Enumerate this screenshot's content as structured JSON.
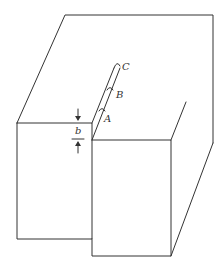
{
  "diagram": {
    "type": "3d-block-with-crack",
    "labels": {
      "point_a": "A",
      "point_b": "B",
      "point_c": "C",
      "dimension_b": "b"
    },
    "colors": {
      "stroke": "#333333",
      "background": "#ffffff"
    }
  }
}
